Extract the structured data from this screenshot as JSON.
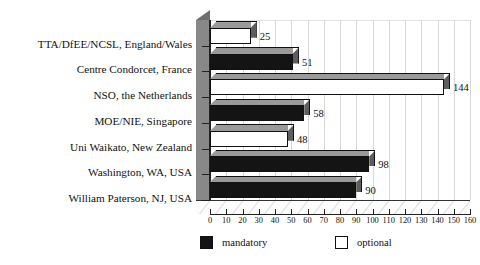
{
  "chart_data": {
    "type": "bar",
    "orientation": "horizontal",
    "title": "",
    "xlabel": "",
    "ylabel": "",
    "xlim": [
      0,
      160
    ],
    "xticks": [
      0,
      10,
      20,
      30,
      40,
      50,
      60,
      70,
      80,
      90,
      100,
      110,
      120,
      130,
      140,
      150,
      160
    ],
    "grid": true,
    "legend_position": "bottom",
    "style_3d": true,
    "categories": [
      "TTA/DfEE/NCSL, England/Wales",
      "Centre Condorcet, France",
      "NSO, the Netherlands",
      "MOE/NIE, Singapore",
      "Uni Waikato, New Zealand",
      "Washington, WA, USA",
      "William Paterson, NJ, USA"
    ],
    "values": [
      25,
      51,
      144,
      58,
      48,
      98,
      90
    ],
    "value_labels": [
      "25",
      "51",
      "144",
      "58",
      "48",
      "98",
      "90"
    ],
    "series_of_bar": [
      "optional",
      "mandatory",
      "optional",
      "mandatory",
      "optional",
      "mandatory",
      "mandatory"
    ],
    "legend": [
      {
        "key": "mandatory",
        "label": "mandatory",
        "color": "#141414"
      },
      {
        "key": "optional",
        "label": "optional",
        "color": "#ffffff"
      }
    ]
  }
}
